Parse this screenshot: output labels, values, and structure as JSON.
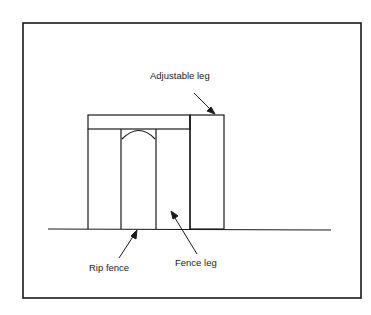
{
  "diagram": {
    "type": "technical-illustration",
    "labels": {
      "adjustable_leg": "Adjustable leg",
      "rip_fence": "Rip fence",
      "fence_leg": "Fence leg"
    },
    "colors": {
      "line": "#1a1a1a",
      "background": "#ffffff"
    }
  }
}
